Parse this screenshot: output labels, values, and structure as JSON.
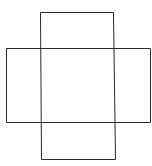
{
  "diagram": {
    "type": "cross-shaped box net",
    "stroke_color": "#2a2a2a",
    "lines": [
      {
        "name": "top-edge",
        "x1": 40,
        "y1": 12,
        "x2": 113,
        "y2": 12
      },
      {
        "name": "left-vertical",
        "x1": 40,
        "y1": 12,
        "x2": 41,
        "y2": 159
      },
      {
        "name": "right-vertical",
        "x1": 113,
        "y1": 12,
        "x2": 115,
        "y2": 159
      },
      {
        "name": "upper-horizontal",
        "x1": 6,
        "y1": 48,
        "x2": 150,
        "y2": 48
      },
      {
        "name": "lower-horizontal",
        "x1": 6,
        "y1": 122,
        "x2": 150,
        "y2": 122
      },
      {
        "name": "left-edge",
        "x1": 6,
        "y1": 48,
        "x2": 6,
        "y2": 122
      },
      {
        "name": "right-edge",
        "x1": 150,
        "y1": 48,
        "x2": 150,
        "y2": 122
      },
      {
        "name": "bottom-edge",
        "x1": 41,
        "y1": 159,
        "x2": 115,
        "y2": 159
      }
    ]
  }
}
